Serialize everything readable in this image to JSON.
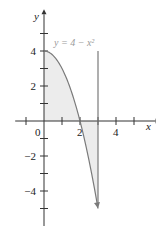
{
  "chart_data": {
    "type": "area",
    "title": "",
    "xlabel": "x",
    "ylabel": "y",
    "xlim": [
      -1.6,
      6.2
    ],
    "ylim": [
      -6,
      6.1
    ],
    "x_ticks": [
      -1,
      0,
      1,
      2,
      3,
      4,
      5
    ],
    "x_tick_labels": [
      {
        "value": 0,
        "label": "0"
      },
      {
        "value": 2,
        "label": "2"
      },
      {
        "value": 4,
        "label": "4"
      }
    ],
    "y_ticks": [
      -5,
      -4,
      -3,
      -2,
      -1,
      1,
      2,
      3,
      4,
      5
    ],
    "y_tick_labels": [
      {
        "value": 4,
        "label": "4"
      },
      {
        "value": 2,
        "label": "2"
      },
      {
        "value": -2,
        "label": "−2"
      },
      {
        "value": -4,
        "label": "−4"
      }
    ],
    "curve": {
      "equation_label": "y = 4 − x²",
      "x_start": 0,
      "x_end": 3,
      "arrow_at_end": true,
      "color": "#7a7a7a"
    },
    "vertical_line": {
      "x": 3,
      "y_top": 4,
      "y_bottom": -5,
      "color": "#7a7a7a"
    },
    "shaded_regions": [
      {
        "from_x": 0,
        "to_x": 2,
        "between": "curve and x-axis",
        "color": "#ececec"
      },
      {
        "from_x": 2,
        "to_x": 3,
        "between": "x-axis and curve",
        "color": "#ececec"
      }
    ],
    "grid": false,
    "legend": "none"
  }
}
